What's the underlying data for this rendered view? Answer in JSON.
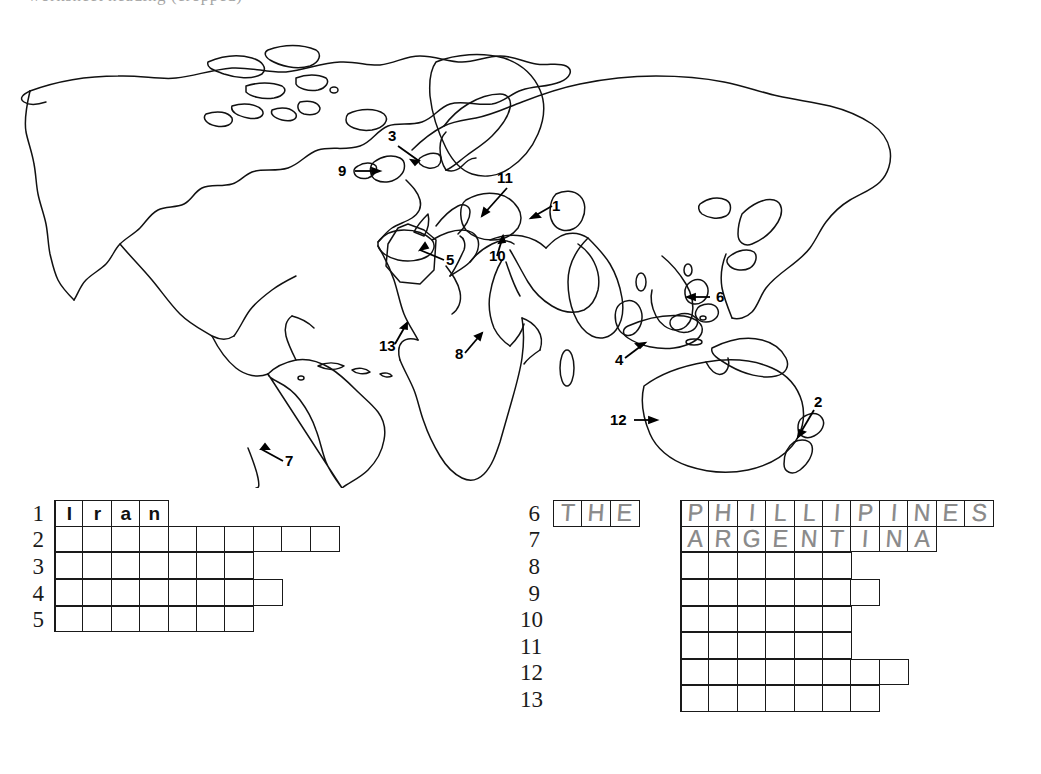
{
  "header_fragment": "worksheet heading (cropped)",
  "colors": {
    "ink": "#1a1a1a",
    "pencil": "#8a8a8a",
    "paper": "#ffffff"
  },
  "map": {
    "title": "Outline world map with 13 numbered arrow pointers",
    "labels": [
      {
        "id": "1",
        "text": "1",
        "x": 555,
        "y": 190,
        "target": "Iran / Middle East"
      },
      {
        "id": "2",
        "text": "2",
        "x": 818,
        "y": 386,
        "target": "New Zealand"
      },
      {
        "id": "3",
        "text": "3",
        "x": 391,
        "y": 117,
        "target": "Denmark / Scandinavia"
      },
      {
        "id": "4",
        "text": "4",
        "x": 618,
        "y": 343,
        "target": "Indonesia / Java"
      },
      {
        "id": "5",
        "text": "5",
        "x": 448,
        "y": 245,
        "target": "Algeria / North Africa"
      },
      {
        "id": "6",
        "text": "6",
        "x": 719,
        "y": 277,
        "target": "Philippines"
      },
      {
        "id": "7",
        "text": "7",
        "x": 288,
        "y": 446,
        "target": "Argentina"
      },
      {
        "id": "8",
        "text": "8",
        "x": 458,
        "y": 341,
        "target": "Somalia / East Africa"
      },
      {
        "id": "9",
        "text": "9",
        "x": 343,
        "y": 153,
        "target": "United Kingdom / Ireland"
      },
      {
        "id": "10",
        "text": "10",
        "x": 492,
        "y": 244,
        "target": "Israel / Lebanon"
      },
      {
        "id": "11",
        "text": "11",
        "x": 500,
        "y": 160,
        "target": "Turkey / Black Sea"
      },
      {
        "id": "12",
        "text": "12",
        "x": 616,
        "y": 400,
        "target": "Australia"
      },
      {
        "id": "13",
        "text": "13",
        "x": 385,
        "y": 329,
        "target": "Nigeria / West Africa"
      }
    ]
  },
  "puzzle": {
    "left_column": {
      "rows": [
        {
          "number": "1",
          "cells": 4,
          "letters": [
            "I",
            "r",
            "a",
            "n"
          ],
          "style": "typed",
          "prefix": null
        },
        {
          "number": "2",
          "cells": 10,
          "letters": [
            "",
            "",
            "",
            "",
            "",
            "",
            "",
            "",
            "",
            ""
          ],
          "style": "blank",
          "prefix": null
        },
        {
          "number": "3",
          "cells": 7,
          "letters": [
            "",
            "",
            "",
            "",
            "",
            "",
            ""
          ],
          "style": "blank",
          "prefix": null
        },
        {
          "number": "4",
          "cells": 8,
          "letters": [
            "",
            "",
            "",
            "",
            "",
            "",
            "",
            ""
          ],
          "style": "blank",
          "prefix": null
        },
        {
          "number": "5",
          "cells": 7,
          "letters": [
            "",
            "",
            "",
            "",
            "",
            "",
            ""
          ],
          "style": "blank",
          "prefix": null
        }
      ]
    },
    "right_column": {
      "rows": [
        {
          "number": "6",
          "cells": 11,
          "letters": [
            "P",
            "H",
            "I",
            "L",
            "L",
            "I",
            "P",
            "I",
            "N",
            "E",
            "S"
          ],
          "style": "hand",
          "prefix": [
            "T",
            "H",
            "E"
          ]
        },
        {
          "number": "7",
          "cells": 9,
          "letters": [
            "A",
            "R",
            "G",
            "E",
            "N",
            "T",
            "I",
            "N",
            "A"
          ],
          "style": "hand",
          "prefix": null
        },
        {
          "number": "8",
          "cells": 6,
          "letters": [
            "",
            "",
            "",
            "",
            "",
            ""
          ],
          "style": "blank",
          "prefix": null
        },
        {
          "number": "9",
          "cells": 7,
          "letters": [
            "",
            "",
            "",
            "",
            "",
            "",
            ""
          ],
          "style": "blank",
          "prefix": null
        },
        {
          "number": "10",
          "cells": 6,
          "letters": [
            "",
            "",
            "",
            "",
            "",
            ""
          ],
          "style": "blank",
          "prefix": null
        },
        {
          "number": "11",
          "cells": 6,
          "letters": [
            "",
            "",
            "",
            "",
            "",
            ""
          ],
          "style": "blank",
          "prefix": null
        },
        {
          "number": "12",
          "cells": 8,
          "letters": [
            "",
            "",
            "",
            "",
            "",
            "",
            "",
            ""
          ],
          "style": "blank",
          "prefix": null
        },
        {
          "number": "13",
          "cells": 7,
          "letters": [
            "",
            "",
            "",
            "",
            "",
            "",
            ""
          ],
          "style": "blank",
          "prefix": null
        }
      ]
    }
  }
}
